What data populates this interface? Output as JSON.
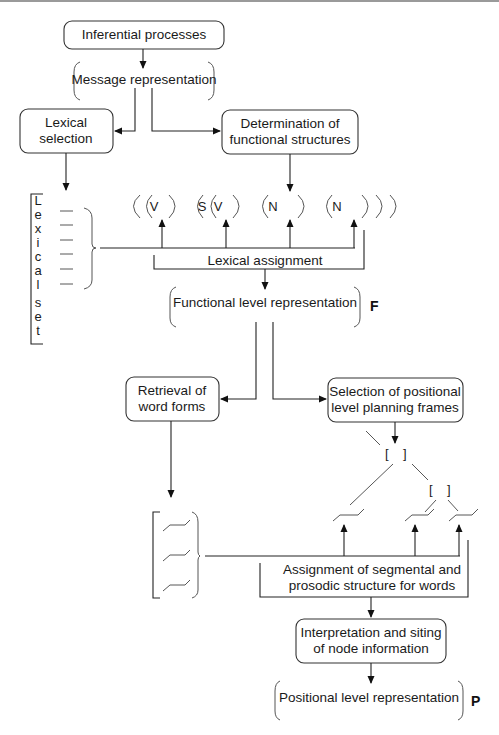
{
  "diagram": {
    "nodes": {
      "inferential": "Inferential processes",
      "message_rep": "Message representation",
      "lexical_selection": [
        "Lexical",
        "selection"
      ],
      "determination": [
        "Determination of",
        "functional structures"
      ],
      "lexical_assignment": "Lexical assignment",
      "functional_rep": "Functional level representation",
      "functional_label": "F",
      "retrieval": [
        "Retrieval of",
        "word forms"
      ],
      "selection_frames": [
        "Selection of positional",
        "level planning frames"
      ],
      "segmental": [
        "Assignment of segmental and",
        "prosodic structure for words"
      ],
      "interpretation": [
        "Interpretation and siting",
        "of node information"
      ],
      "positional_rep": "Positional level representation",
      "positional_label": "P"
    },
    "lexical_set_letters": [
      "L",
      "e",
      "x",
      "i",
      "c",
      "a",
      "l",
      "s",
      "e",
      "t"
    ],
    "functional_slots": [
      {
        "label": "V"
      },
      {
        "label": "S"
      },
      {
        "label": "V"
      },
      {
        "label": "N"
      },
      {
        "label": "N"
      }
    ],
    "frame_brackets": [
      "[",
      "]",
      "[",
      "]"
    ]
  }
}
